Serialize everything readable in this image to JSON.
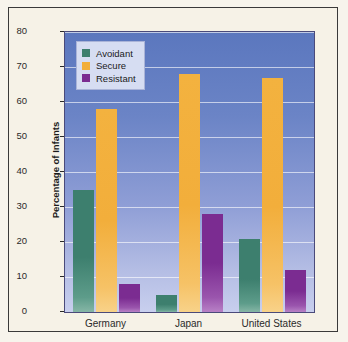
{
  "chart_data": {
    "type": "bar",
    "title": "",
    "xlabel": "",
    "ylabel": "Percentage of Infants",
    "ylim": [
      0,
      80
    ],
    "ytick_step": 10,
    "yticks": [
      "0",
      "10",
      "20",
      "30",
      "40",
      "50",
      "60",
      "70",
      "80"
    ],
    "grid": true,
    "legend_position": "top-left",
    "categories": [
      "Germany",
      "Japan",
      "United States"
    ],
    "series": [
      {
        "name": "Avoidant",
        "color": "#3d7f6e",
        "values": [
          35,
          5,
          21
        ]
      },
      {
        "name": "Secure",
        "color": "#f2ae3b",
        "values": [
          58,
          68,
          67
        ]
      },
      {
        "name": "Resistant",
        "color": "#7b2c91",
        "values": [
          8,
          28,
          12
        ]
      }
    ]
  },
  "figure": {
    "plot_background_top": "#5b77be",
    "plot_background_bottom": "#c8cfee",
    "page_background": "#f6f2e7",
    "frame_color": "#3a3a3a"
  }
}
